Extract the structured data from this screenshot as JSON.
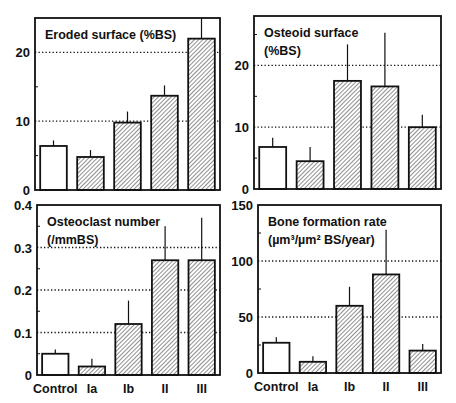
{
  "figure": {
    "categories": [
      "Control",
      "Ia",
      "Ib",
      "II",
      "III"
    ],
    "colors": {
      "ink": "#111111",
      "background": "#ffffff",
      "control_fill": "#ffffff",
      "hatch": "#333333"
    }
  },
  "chart_data": [
    {
      "type": "bar",
      "panel": "top-left",
      "title": "Eroded surface (%BS)",
      "title_lines": [
        "Eroded surface (%BS)"
      ],
      "categories": [
        "Control",
        "Ia",
        "Ib",
        "II",
        "III"
      ],
      "values": [
        6.4,
        4.8,
        9.8,
        13.7,
        22.0
      ],
      "error_upper": [
        0.8,
        1.0,
        1.6,
        1.5,
        3.0
      ],
      "ylim": [
        0,
        25
      ],
      "yticks": [
        0,
        10,
        20
      ],
      "ytick_labels": [
        "0",
        "10",
        "20"
      ],
      "minor_ticks": [
        5,
        15
      ],
      "gridlines": [
        10,
        20
      ],
      "grid": "dotted at labelled ticks",
      "xlabel": "",
      "ylabel": "",
      "show_xticklabels": false,
      "frame": {
        "x0": 35,
        "y0": 18,
        "x1": 220,
        "y1": 190
      }
    },
    {
      "type": "bar",
      "panel": "top-right",
      "title": "Osteoid surface (%BS)",
      "title_lines": [
        "Osteoid surface",
        "(%BS)"
      ],
      "categories": [
        "Control",
        "Ia",
        "Ib",
        "II",
        "III"
      ],
      "values": [
        6.8,
        4.5,
        17.5,
        16.6,
        10.0
      ],
      "error_upper": [
        1.5,
        2.3,
        5.9,
        8.7,
        2.0
      ],
      "ylim": [
        0,
        28
      ],
      "yticks": [
        0,
        10,
        20
      ],
      "ytick_labels": [
        "0",
        "10",
        "20"
      ],
      "minor_ticks": [
        5,
        15,
        25
      ],
      "gridlines": [
        10,
        20
      ],
      "grid": "dotted at labelled ticks",
      "xlabel": "",
      "ylabel": "",
      "show_xticklabels": false,
      "frame": {
        "x0": 254,
        "y0": 16,
        "x1": 441,
        "y1": 189
      }
    },
    {
      "type": "bar",
      "panel": "bottom-left",
      "title": "Osteoclast number (/mmBS)",
      "title_lines": [
        "Osteoclast number",
        "(/mmBS)"
      ],
      "categories": [
        "Control",
        "Ia",
        "Ib",
        "II",
        "III"
      ],
      "values": [
        0.05,
        0.02,
        0.12,
        0.27,
        0.27
      ],
      "error_upper": [
        0.01,
        0.018,
        0.055,
        0.08,
        0.1
      ],
      "ylim": [
        0,
        0.4
      ],
      "yticks": [
        0,
        0.1,
        0.2,
        0.3,
        0.4
      ],
      "ytick_labels": [
        "0",
        "0.1",
        "0.2",
        "0.3",
        "0.4"
      ],
      "minor_ticks": [
        0.05,
        0.15,
        0.25,
        0.35
      ],
      "gridlines": [
        0.1,
        0.2,
        0.3
      ],
      "grid": "dotted at labelled ticks",
      "xlabel": "",
      "ylabel": "",
      "show_xticklabels": true,
      "frame": {
        "x0": 37,
        "y0": 205,
        "x1": 220,
        "y1": 375
      }
    },
    {
      "type": "bar",
      "panel": "bottom-right",
      "title": "Bone formation rate (µm3/µm2 BS/year)",
      "title_lines": [
        "Bone formation rate",
        "(µm³/µm² BS/year)"
      ],
      "categories": [
        "Control",
        "Ia",
        "Ib",
        "II",
        "III"
      ],
      "values": [
        27,
        10,
        60,
        88,
        20
      ],
      "error_upper": [
        5,
        5,
        17,
        40,
        6
      ],
      "ylim": [
        0,
        150
      ],
      "yticks": [
        0,
        50,
        100,
        150
      ],
      "ytick_labels": [
        "0",
        "50",
        "100",
        "150"
      ],
      "minor_ticks": [
        25,
        75,
        125
      ],
      "gridlines": [
        50,
        100
      ],
      "grid": "dotted at labelled ticks",
      "xlabel": "",
      "ylabel": "",
      "show_xticklabels": true,
      "frame": {
        "x0": 258,
        "y0": 205,
        "x1": 441,
        "y1": 373
      }
    }
  ]
}
